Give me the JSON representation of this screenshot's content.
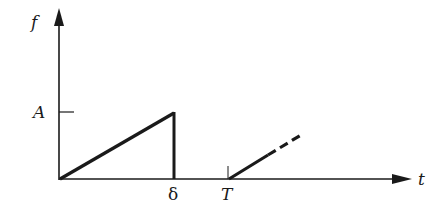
{
  "diagram": {
    "type": "signal-waveform",
    "axes": {
      "y_label": "f",
      "x_label": "t"
    },
    "labels": {
      "amplitude": "A",
      "pulse_width": "δ",
      "period": "T"
    },
    "colors": {
      "line": "#1a1a1a",
      "background": "#ffffff"
    }
  }
}
